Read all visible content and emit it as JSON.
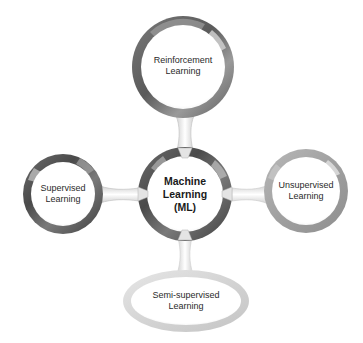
{
  "diagram": {
    "title": "",
    "center": {
      "label": "Machine\nLearning\n(ML)"
    },
    "nodes": [
      {
        "id": "reinforcement",
        "label": "Reinforcement\nLearning",
        "position": "top"
      },
      {
        "id": "supervised",
        "label": "Supervised\nLearning",
        "position": "left"
      },
      {
        "id": "unsupervised",
        "label": "Unsupervised\nLearning",
        "position": "right"
      },
      {
        "id": "semi-supervised",
        "label": "Semi-supervised\nLearning",
        "position": "bottom"
      }
    ],
    "colors": {
      "ring_dark": "#555555",
      "ring_mid": "#8a8a8a",
      "ring_light": "#c8c8c8",
      "ring_pale": "#e2e2e2",
      "fill": "#ffffff",
      "text": "#2a2a2a"
    }
  }
}
